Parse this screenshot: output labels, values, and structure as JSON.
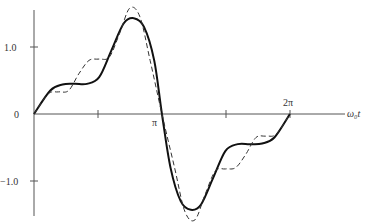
{
  "chart_data": {
    "type": "line",
    "title": "",
    "xlabel": "ω0 t",
    "ylabel": "",
    "x_ticks": [
      "π",
      "2π"
    ],
    "y_ticks": [
      "1.0",
      "0",
      "−1.0"
    ],
    "xlim": [
      0,
      6.6
    ],
    "ylim": [
      -1.65,
      1.65
    ],
    "grid": false,
    "legend": null,
    "series": [
      {
        "name": "solid",
        "style": "solid",
        "x": [
          0,
          0.4,
          0.7,
          1.0,
          1.3,
          1.6,
          1.9,
          2.2,
          2.45,
          2.7,
          2.95,
          3.14,
          3.35,
          3.6,
          3.85,
          4.1,
          4.4,
          4.7,
          5.0,
          5.3,
          5.6,
          5.9,
          6.28
        ],
        "values": [
          0,
          0.35,
          0.44,
          0.45,
          0.45,
          0.55,
          0.95,
          1.35,
          1.43,
          1.3,
          0.8,
          0.0,
          -0.8,
          -1.3,
          -1.43,
          -1.35,
          -0.95,
          -0.55,
          -0.45,
          -0.45,
          -0.44,
          -0.35,
          0
        ]
      },
      {
        "name": "dashed",
        "style": "dashed",
        "x": [
          0,
          0.35,
          0.6,
          0.85,
          1.1,
          1.35,
          1.6,
          1.85,
          2.1,
          2.35,
          2.6,
          2.85,
          3.14,
          3.45,
          3.7,
          3.95,
          4.2,
          4.45,
          4.7,
          4.95,
          5.2,
          5.45,
          5.7,
          5.95,
          6.28
        ],
        "values": [
          0,
          0.3,
          0.33,
          0.35,
          0.6,
          0.8,
          0.82,
          0.85,
          1.2,
          1.58,
          1.45,
          0.8,
          0.0,
          -0.8,
          -1.45,
          -1.58,
          -1.2,
          -0.85,
          -0.82,
          -0.8,
          -0.6,
          -0.35,
          -0.33,
          -0.3,
          0
        ]
      }
    ]
  },
  "labels": {
    "y_pos": "1.0",
    "y_zero": "0",
    "y_neg": "−1.0",
    "x_pi": "π",
    "x_2pi": "2π",
    "x_axis": "ω₀t"
  }
}
